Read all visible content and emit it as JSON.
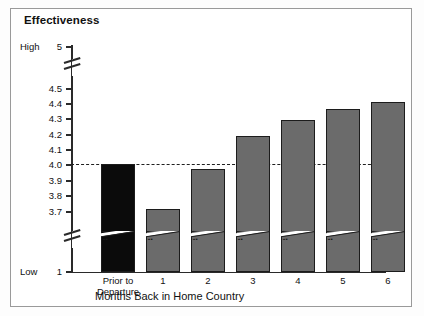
{
  "figure": {
    "title": "Effectiveness",
    "xaxis_title": "Months Back in Home Country",
    "high_label": "High",
    "low_label": "Low",
    "colors": {
      "bar_gray": "#6b6b6b",
      "bar_black": "#0b0b0b",
      "bar_outline": "#1c1c1c",
      "axis": "#2a2a2a",
      "frame": "#9a9a9a",
      "reference_line": "#1f1f1f",
      "background": "#ffffff"
    }
  },
  "chart_data": {
    "type": "bar",
    "title": "Effectiveness",
    "xlabel": "Months Back in Home Country",
    "ylabel": "Effectiveness",
    "categories": [
      "Prior to\nDeparture",
      "1",
      "2",
      "3",
      "4",
      "5",
      "6"
    ],
    "values": [
      4.0,
      3.72,
      3.97,
      4.19,
      4.29,
      4.36,
      4.41
    ],
    "bar_colors": [
      "#0b0b0b",
      "#6b6b6b",
      "#6b6b6b",
      "#6b6b6b",
      "#6b6b6b",
      "#6b6b6b",
      "#6b6b6b"
    ],
    "ylim": [
      1,
      5
    ],
    "y_tick_labels": [
      "5",
      "4.5",
      "4.4",
      "4.3",
      "4.2",
      "4.1",
      "4.0",
      "3.9",
      "3.8",
      "3.7",
      "1"
    ],
    "y_tick_values": [
      5,
      4.5,
      4.4,
      4.3,
      4.2,
      4.1,
      4.0,
      3.9,
      3.8,
      3.7,
      1
    ],
    "y_axis_endpoint_labels": {
      "top": "High",
      "bottom": "Low"
    },
    "axis_breaks": [
      {
        "between": [
          5,
          4.5
        ],
        "note": "broken y-axis above 4.5"
      },
      {
        "between": [
          3.7,
          1
        ],
        "note": "broken y-axis below 3.7"
      }
    ],
    "bars_have_axis_break_slash": true,
    "reference_lines": [
      {
        "value": 4.0,
        "style": "dashed",
        "axis": "y"
      }
    ],
    "grid": false,
    "legend": null
  },
  "ticks": [
    {
      "label": "5",
      "y": 47,
      "cap": "High"
    },
    {
      "label": "4.5",
      "y": 89
    },
    {
      "label": "4.4",
      "y": 104
    },
    {
      "label": "4.3",
      "y": 119
    },
    {
      "label": "4.2",
      "y": 135
    },
    {
      "label": "4.1",
      "y": 150
    },
    {
      "label": "4.0",
      "y": 165
    },
    {
      "label": "3.9",
      "y": 181
    },
    {
      "label": "3.8",
      "y": 196
    },
    {
      "label": "3.7",
      "y": 212
    },
    {
      "label": "1",
      "y": 272,
      "cap": "Low"
    }
  ],
  "bars": [
    {
      "name": "Prior to Departure",
      "label": "Prior to\nDeparture",
      "value": 4.0,
      "x": 101,
      "w": 34,
      "top": 164,
      "color": "black"
    },
    {
      "name": "Month 1",
      "label": "1",
      "value": 3.72,
      "x": 146,
      "w": 34,
      "top": 209,
      "color": "gray"
    },
    {
      "name": "Month 2",
      "label": "2",
      "value": 3.97,
      "x": 191,
      "w": 34,
      "top": 169,
      "color": "gray"
    },
    {
      "name": "Month 3",
      "label": "3",
      "value": 4.19,
      "x": 236,
      "w": 34,
      "top": 136,
      "color": "gray"
    },
    {
      "name": "Month 4",
      "label": "4",
      "value": 4.29,
      "x": 281,
      "w": 34,
      "top": 120,
      "color": "gray"
    },
    {
      "name": "Month 5",
      "label": "5",
      "value": 4.36,
      "x": 326,
      "w": 34,
      "top": 109,
      "color": "gray"
    },
    {
      "name": "Month 6",
      "label": "6",
      "value": 4.41,
      "x": 371,
      "w": 34,
      "top": 102,
      "color": "gray"
    }
  ],
  "geometry": {
    "axis_x": 71,
    "baseline_y": 272,
    "axis_top_y": 45,
    "refline_y": 164,
    "bar_break_y": 231,
    "catlabel_y": 276
  }
}
